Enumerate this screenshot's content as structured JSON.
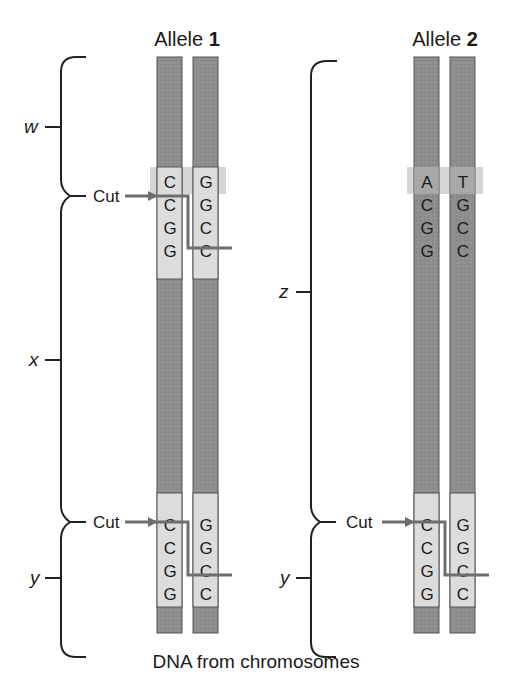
{
  "title": "DNA from chromosomes",
  "alleles": [
    {
      "label_prefix": "Allele",
      "label_number": "1",
      "top_site": {
        "left": [
          "C",
          "C",
          "G",
          "G"
        ],
        "right": [
          "G",
          "G",
          "C",
          "C"
        ],
        "cut": true
      },
      "bottom_site": {
        "left": [
          "C",
          "C",
          "G",
          "G"
        ],
        "right": [
          "G",
          "G",
          "C",
          "C"
        ],
        "cut": true
      }
    },
    {
      "label_prefix": "Allele",
      "label_number": "2",
      "top_site": {
        "left": [
          "A",
          "C",
          "G",
          "G"
        ],
        "right": [
          "T",
          "G",
          "C",
          "C"
        ],
        "cut": false
      },
      "bottom_site": {
        "left": [
          "C",
          "C",
          "G",
          "G"
        ],
        "right": [
          "G",
          "G",
          "C",
          "C"
        ],
        "cut": true
      }
    }
  ],
  "segments": {
    "allele1": [
      "w",
      "x",
      "y"
    ],
    "allele2": [
      "z",
      "y"
    ]
  },
  "cut_label": "Cut",
  "colors": {
    "strand": "#8c8c8c",
    "strand_border": "#555555",
    "site_box": "#dcdcdc",
    "highlight_band": "#d8d8d8",
    "cut_line": "#6e6e6e",
    "brace": "#222222",
    "text": "#1a1a1a"
  }
}
